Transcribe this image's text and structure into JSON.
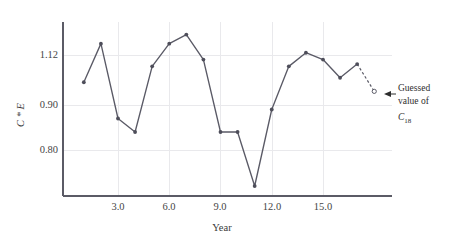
{
  "chart_data": {
    "type": "line",
    "title": "",
    "xlabel": "Year",
    "ylabel": "C * E",
    "x": [
      1,
      2,
      3,
      4,
      5,
      6,
      7,
      8,
      9,
      10,
      11,
      12,
      13,
      14,
      15,
      16,
      17,
      18
    ],
    "values": [
      1.0,
      1.17,
      0.87,
      0.84,
      1.07,
      1.17,
      1.21,
      1.1,
      0.84,
      0.84,
      0.72,
      0.89,
      1.07,
      1.13,
      1.1,
      1.02,
      1.08,
      0.96
    ],
    "series": [
      {
        "name": "C * E",
        "values": [
          1.0,
          1.17,
          0.87,
          0.84,
          1.07,
          1.17,
          1.21,
          1.1,
          0.84,
          0.84,
          0.72,
          0.89,
          1.07,
          1.13,
          1.1,
          1.02,
          1.08,
          0.96
        ]
      }
    ],
    "xticks": [
      "3.0",
      "6.0",
      "9.0",
      "12.0",
      "15.0"
    ],
    "xtick_values": [
      3.0,
      6.0,
      9.0,
      12.0,
      15.0
    ],
    "yticks": [
      "1.12",
      "0.90",
      "0.80"
    ],
    "ytick_values": [
      1.12,
      0.9,
      0.8
    ],
    "xlim": [
      0.3,
      18.9
    ],
    "ylim": [
      0.66,
      1.26
    ],
    "grid": true,
    "legend": "none",
    "last_point_style": "open-circle-dashed",
    "annotations": [
      {
        "name": "guessed-value",
        "line1": "Guessed",
        "line2": "value of",
        "symbol": "C",
        "subscript": "18",
        "target_point_index": 17
      }
    ],
    "colors": {
      "line": "#5a5a66",
      "marker": "#4e4e5a",
      "grid": "#e9e9ec",
      "axis": "#5b5b66",
      "text": "#3a3a3a"
    }
  }
}
